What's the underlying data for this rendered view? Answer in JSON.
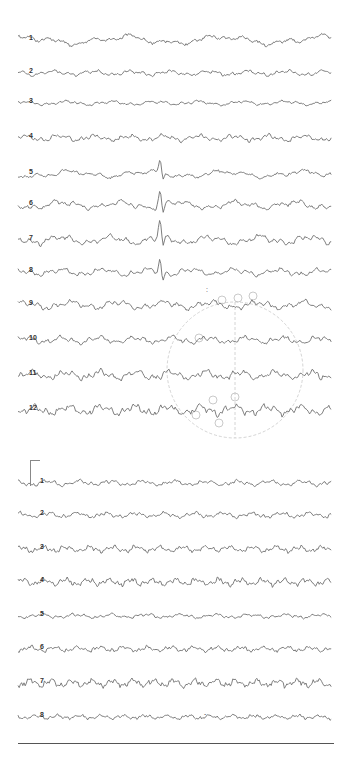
{
  "figure": {
    "type": "EEG recording (scanned)",
    "trace_color": "#6f6f6f",
    "background": "#ffffff"
  },
  "upper_panel": {
    "channel_count": 12,
    "channels": [
      {
        "label": "1",
        "y": 40,
        "amp": 5,
        "freq": 0.35,
        "seed": 1
      },
      {
        "label": "2",
        "y": 73,
        "amp": 3,
        "freq": 0.9,
        "seed": 2
      },
      {
        "label": "3",
        "y": 103,
        "amp": 2.5,
        "freq": 0.8,
        "seed": 3
      },
      {
        "label": "4",
        "y": 138,
        "amp": 3.5,
        "freq": 1.0,
        "seed": 4
      },
      {
        "label": "5",
        "y": 174,
        "amp": 4,
        "freq": 0.45,
        "seed": 5
      },
      {
        "label": "6",
        "y": 205,
        "amp": 4.5,
        "freq": 0.6,
        "seed": 6
      },
      {
        "label": "7",
        "y": 240,
        "amp": 5,
        "freq": 0.7,
        "seed": 7
      },
      {
        "label": "8",
        "y": 272,
        "amp": 4,
        "freq": 0.8,
        "seed": 8
      },
      {
        "label": "9",
        "y": 305,
        "amp": 4.5,
        "freq": 0.75,
        "seed": 9
      },
      {
        "label": "10",
        "y": 340,
        "amp": 4,
        "freq": 0.95,
        "seed": 10
      },
      {
        "label": "11",
        "y": 375,
        "amp": 5,
        "freq": 1.0,
        "seed": 11
      },
      {
        "label": "12",
        "y": 410,
        "amp": 5.5,
        "freq": 1.05,
        "seed": 12
      }
    ],
    "spike": {
      "x": 160,
      "channels": [
        "5",
        "6",
        "7",
        "8"
      ]
    },
    "annotation_mark": {
      "text": ":",
      "x": 206,
      "y": 286
    }
  },
  "lower_panel": {
    "channel_count": 8,
    "calibration_marker": {
      "x": 30,
      "top": 460,
      "bottom": 486,
      "tick_width": 10
    },
    "channels": [
      {
        "label": "1",
        "y": 483,
        "amp": 3,
        "freq": 1.1,
        "seed": 21
      },
      {
        "label": "2",
        "y": 515,
        "amp": 3,
        "freq": 1.2,
        "seed": 22
      },
      {
        "label": "3",
        "y": 549,
        "amp": 3.5,
        "freq": 1.5,
        "seed": 23
      },
      {
        "label": "4",
        "y": 582,
        "amp": 4,
        "freq": 1.6,
        "seed": 24
      },
      {
        "label": "5",
        "y": 616,
        "amp": 2.5,
        "freq": 1.0,
        "seed": 25
      },
      {
        "label": "6",
        "y": 649,
        "amp": 3,
        "freq": 1.5,
        "seed": 26
      },
      {
        "label": "7",
        "y": 683,
        "amp": 4.5,
        "freq": 1.7,
        "seed": 27
      },
      {
        "label": "8",
        "y": 717,
        "amp": 2.5,
        "freq": 1.6,
        "seed": 28
      }
    ],
    "annotation_mark": {
      "text": "-",
      "x": 204,
      "y": 712
    }
  },
  "baseline": {
    "y": 743
  },
  "watermark": {
    "description": "faint electrode head diagram",
    "cx": 235,
    "cy": 370,
    "r": 68,
    "electrodes": [
      {
        "x": 213,
        "y": 400
      },
      {
        "x": 235,
        "y": 397
      },
      {
        "x": 196,
        "y": 415
      },
      {
        "x": 219,
        "y": 423
      },
      {
        "x": 222,
        "y": 300
      },
      {
        "x": 238,
        "y": 298
      },
      {
        "x": 253,
        "y": 296
      },
      {
        "x": 199,
        "y": 338
      }
    ]
  }
}
